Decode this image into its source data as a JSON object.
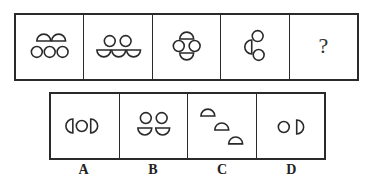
{
  "puzzle": {
    "question_mark": "?",
    "sequence": [
      {
        "id": 1,
        "description": "2 upward half-circles (top) over 3 circles (bottom)"
      },
      {
        "id": 2,
        "description": "2 circles (top) over 3 downward half-circles (bottom)"
      },
      {
        "id": 3,
        "description": "up half-circle top, 2 circles middle, down half-circle bottom"
      },
      {
        "id": 4,
        "description": "left-facing half-circle with 2 circles stacked at right"
      },
      {
        "id": 5,
        "description": "unknown"
      }
    ],
    "options": [
      {
        "label": "A",
        "description": "left half-circle, circle, right half-circle in a row"
      },
      {
        "label": "B",
        "description": "2 circles over 2 downward half-circles"
      },
      {
        "label": "C",
        "description": "3 upward half-circles on a diagonal"
      },
      {
        "label": "D",
        "description": "circle and right-facing half-circle"
      }
    ]
  },
  "colors": {
    "stroke": "#2a2a2a",
    "background": "#ffffff"
  }
}
